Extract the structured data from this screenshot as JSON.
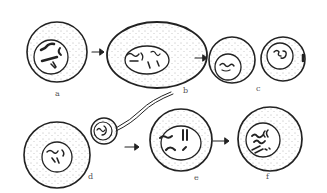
{
  "diagram": {
    "type": "biological-illustration",
    "stages": [
      {
        "id": "a",
        "label": "a"
      },
      {
        "id": "b",
        "label": "b"
      },
      {
        "id": "c",
        "label": "c"
      },
      {
        "id": "d",
        "label": "d"
      },
      {
        "id": "e",
        "label": "e"
      },
      {
        "id": "f",
        "label": "f"
      }
    ],
    "colors": {
      "ink": "#222222",
      "background": "#ffffff"
    }
  }
}
